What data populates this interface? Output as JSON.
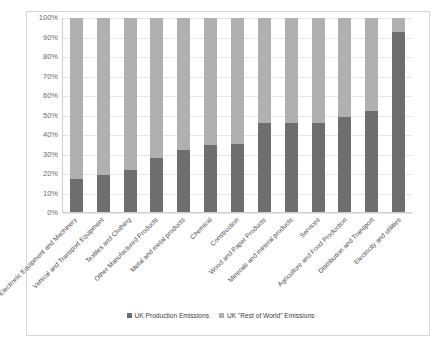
{
  "chart_data": {
    "type": "bar",
    "subtype": "stacked-100-percent",
    "title": "",
    "xlabel": "",
    "ylabel": "",
    "ylim": [
      0,
      100
    ],
    "ytick_labels": [
      "100%",
      "90%",
      "80%",
      "70%",
      "60%",
      "50%",
      "40%",
      "30%",
      "20%",
      "10%",
      "0%"
    ],
    "ytick_values": [
      100,
      90,
      80,
      70,
      60,
      50,
      40,
      30,
      20,
      10,
      0
    ],
    "grid": true,
    "legend_position": "bottom",
    "categories": [
      "Electronic Equipment and Machinery",
      "Vehical and Transport Equipment",
      "Textiles and Clothing",
      "Other Manufactured Products",
      "Metal and metal products",
      "Chemical",
      "Construction",
      "Wood and Paper Products",
      "Minerals and mineral products",
      "Services",
      "Agriculture and Food Production",
      "Distribution and Transport",
      "Electricity and utilities"
    ],
    "series": [
      {
        "name": "UK Production Emissions",
        "color": "#6e6e6e",
        "values": [
          17,
          19,
          21.5,
          28,
          32,
          34.5,
          35,
          46,
          46,
          46,
          49,
          52,
          93
        ]
      },
      {
        "name": "UK \"Rest of World\" Emissions",
        "color": "#b0b0b0",
        "values": [
          83,
          81,
          78.5,
          72,
          68,
          65.5,
          65,
          54,
          54,
          54,
          51,
          48,
          7
        ]
      }
    ]
  },
  "legend": {
    "items": [
      {
        "label": "UK Production Emissions",
        "color": "#6e6e6e"
      },
      {
        "label": "UK \"Rest of World\" Emissions",
        "color": "#b0b0b0"
      }
    ]
  },
  "colors": {
    "production": "#6e6e6e",
    "rest_of_world": "#b0b0b0",
    "gridline": "#e6e6e6",
    "axis": "#cfcfcf",
    "frame": "#d6d6d6",
    "tick_text": "#6b6b6b",
    "label_text": "#4a4a4a"
  }
}
